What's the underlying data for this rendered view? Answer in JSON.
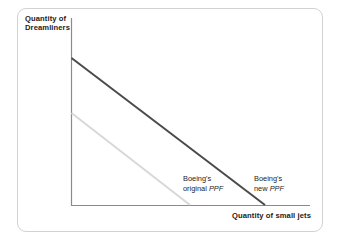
{
  "figure": {
    "type": "ppf-diagram",
    "background_color": "#ffffff",
    "card_border_color": "#d2d2d2"
  },
  "axes": {
    "y_label_line1": "Quantity of",
    "y_label_line2": "Dreamliners",
    "x_label": "Quantity of small jets",
    "axis_color": "#8a8a8a"
  },
  "labels": {
    "original_line1": "Boeing's",
    "original_line2_prefix": "original ",
    "original_line2_italic": "PPF",
    "new_line1": "Boeing's",
    "new_line2_prefix": "new ",
    "new_line2_italic": "PPF"
  },
  "chart_data": {
    "type": "line",
    "title": "",
    "xlabel": "Quantity of small jets",
    "ylabel": "Quantity of Dreamliners",
    "grid": false,
    "legend_position": "inline-annotations",
    "axis_origin": {
      "x": 71,
      "y": 205
    },
    "axis_extent": {
      "x_end": 310,
      "y_top": 18
    },
    "xlim": [
      0,
      100
    ],
    "ylim": [
      0,
      100
    ],
    "series": [
      {
        "name": "Boeing's original PPF",
        "color": "#d8d8d8",
        "stroke_width": 2,
        "x": [
          0,
          49.8
        ],
        "y": [
          49.2,
          0
        ],
        "pixel_start": {
          "x": 71,
          "y": 113
        },
        "pixel_end": {
          "x": 190,
          "y": 205
        }
      },
      {
        "name": "Boeing's new PPF",
        "color": "#4a4a4a",
        "stroke_width": 2,
        "x": [
          0,
          81.2
        ],
        "y": [
          78.6,
          0
        ],
        "pixel_start": {
          "x": 71,
          "y": 58
        },
        "pixel_end": {
          "x": 265,
          "y": 205
        }
      }
    ],
    "annotations": [
      {
        "text": "Boeing's original PPF",
        "x": 183,
        "y": 174
      },
      {
        "text": "Boeing's new PPF",
        "x": 254,
        "y": 174
      }
    ]
  }
}
